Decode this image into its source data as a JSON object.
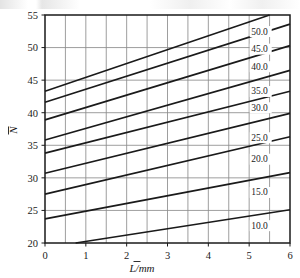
{
  "figure": {
    "name": "nomogram-chart",
    "background_color": "#ffffff",
    "line_color": "#1a1a1a",
    "grid_color": "#8c8c8c"
  },
  "chart_data": {
    "type": "line",
    "title": "",
    "subtitle": "",
    "xlabel": "L̄/mm",
    "xlabel_parts": {
      "symbol": "L",
      "overbar": true,
      "unit": "/mm"
    },
    "ylabel": "N̄",
    "ylabel_parts": {
      "symbol": "N",
      "overbar": true,
      "unit": ""
    },
    "xlim": [
      0,
      6
    ],
    "ylim": [
      20,
      55
    ],
    "xticks": [
      0,
      1,
      2,
      3,
      4,
      5,
      6
    ],
    "xtick_labels": [
      "0",
      "1",
      "2",
      "3",
      "4",
      "5",
      "6"
    ],
    "yticks": [
      20,
      25,
      30,
      35,
      40,
      45,
      50,
      55
    ],
    "ytick_labels": [
      "20",
      "25",
      "30",
      "35",
      "40",
      "45",
      "50",
      "55"
    ],
    "x_minor_step": 0.5,
    "y_minor_step": 5,
    "grid": true,
    "grid_x_step": 0.5,
    "grid_y_step": 5,
    "legend": "inline-right-labels",
    "legend_position": "right-inside",
    "series": [
      {
        "name": "50.0",
        "label": "50.0",
        "x": [
          0.0,
          5.5
        ],
        "y": [
          43.3,
          55.0
        ],
        "label_x": 5.05,
        "label_y": 52.0
      },
      {
        "name": "45.0",
        "label": "45.0",
        "x": [
          0.0,
          6.0
        ],
        "y": [
          41.6,
          53.6
        ],
        "label_x": 5.05,
        "label_y": 49.3
      },
      {
        "name": "40.0",
        "label": "40.0",
        "x": [
          0.0,
          6.0
        ],
        "y": [
          38.9,
          50.3
        ],
        "label_x": 5.05,
        "label_y": 46.6
      },
      {
        "name": "35.0",
        "label": "35.0",
        "x": [
          0.0,
          6.0
        ],
        "y": [
          35.8,
          46.5
        ],
        "label_x": 5.05,
        "label_y": 42.8
      },
      {
        "name": "30.0",
        "label": "30.0",
        "x": [
          0.0,
          6.0
        ],
        "y": [
          33.8,
          43.3
        ],
        "label_x": 5.05,
        "label_y": 40.3
      },
      {
        "name": "25.0",
        "label": "25.0",
        "x": [
          0.0,
          6.0
        ],
        "y": [
          30.7,
          39.9
        ],
        "label_x": 5.05,
        "label_y": 35.7
      },
      {
        "name": "20.0",
        "label": "20.0",
        "x": [
          0.0,
          6.0
        ],
        "y": [
          27.5,
          36.3
        ],
        "label_x": 5.05,
        "label_y": 32.4
      },
      {
        "name": "15.0",
        "label": "15.0",
        "x": [
          0.0,
          6.0
        ],
        "y": [
          23.7,
          30.8
        ],
        "label_x": 5.05,
        "label_y": 27.3
      },
      {
        "name": "10.0",
        "label": "10.0",
        "x": [
          0.75,
          6.0
        ],
        "y": [
          20.0,
          25.1
        ],
        "label_x": 5.05,
        "label_y": 22.2
      }
    ],
    "curve_labels": [
      "50.0",
      "45.0",
      "40.0",
      "35.0",
      "30.0",
      "25.0",
      "20.0",
      "15.0",
      "10.0"
    ]
  }
}
